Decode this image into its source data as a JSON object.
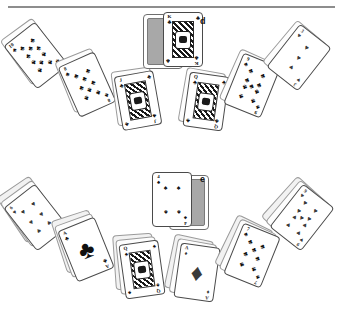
{
  "page": {
    "background": "#ffffff",
    "width": 343,
    "height": 318,
    "divider_color": "#8d8d8d"
  },
  "labels": {
    "top_group": "d",
    "bottom_group": "e"
  },
  "suits": {
    "club": "♣",
    "spade": "♠",
    "heart": "♥",
    "diamond": "♦"
  },
  "groups": [
    {
      "id": "group-d",
      "label": "d",
      "label_x": 200,
      "label_y": 16,
      "description": "Fan of playing cards arranged in an arc, mostly clubs, with a king of clubs and a card back at the apex",
      "cards": [
        {
          "name": "ten-of-clubs",
          "rank": "10",
          "suit": "club",
          "color": "black",
          "kind": "pip",
          "count": 10,
          "x": 16,
          "y": 28,
          "rot": -38,
          "backs": 1
        },
        {
          "name": "eight-of-clubs",
          "rank": "8",
          "suit": "club",
          "color": "black",
          "kind": "pip",
          "count": 8,
          "x": 67,
          "y": 57,
          "rot": -24,
          "backs": 1
        },
        {
          "name": "jack-of-clubs",
          "rank": "J",
          "suit": "club",
          "color": "black",
          "kind": "face",
          "x": 118,
          "y": 73,
          "rot": -10,
          "backs": 1
        },
        {
          "name": "king-of-clubs-center",
          "rank": "K",
          "suit": "club",
          "color": "black",
          "kind": "face",
          "x": 163,
          "y": 12,
          "rot": 0,
          "backs": 1,
          "back_side": "left"
        },
        {
          "name": "queen-of-clubs",
          "rank": "Q",
          "suit": "club",
          "color": "black",
          "kind": "face",
          "x": 186,
          "y": 74,
          "rot": 8,
          "backs": 1
        },
        {
          "name": "nine-of-clubs",
          "rank": "9",
          "suit": "club",
          "color": "black",
          "kind": "pip",
          "count": 9,
          "x": 232,
          "y": 58,
          "rot": 22,
          "backs": 1
        },
        {
          "name": "three-of-hearts",
          "rank": "3",
          "suit": "heart",
          "color": "red",
          "kind": "pip",
          "count": 3,
          "x": 279,
          "y": 30,
          "rot": 38,
          "backs": 1
        }
      ]
    },
    {
      "id": "group-e",
      "label": "e",
      "label_x": 200,
      "label_y": 174,
      "description": "Second fan of playing cards in an arc, mixed suits, with a four of spades and a card back at the apex",
      "cards": [
        {
          "name": "six-of-hearts",
          "rank": "6",
          "suit": "heart",
          "color": "red",
          "kind": "pip",
          "count": 6,
          "x": 16,
          "y": 190,
          "rot": -38,
          "backs": 2
        },
        {
          "name": "ace-of-clubs",
          "rank": "A",
          "suit": "club",
          "color": "black",
          "kind": "ace",
          "x": 66,
          "y": 222,
          "rot": -22,
          "backs": 2
        },
        {
          "name": "queen-of-spades",
          "rank": "Q",
          "suit": "spade",
          "color": "black",
          "kind": "face",
          "x": 122,
          "y": 242,
          "rot": -8,
          "backs": 2
        },
        {
          "name": "four-of-spades-center",
          "rank": "4",
          "suit": "spade",
          "color": "black",
          "kind": "pip",
          "count": 4,
          "x": 152,
          "y": 172,
          "rot": 0,
          "backs": 1,
          "back_side": "right"
        },
        {
          "name": "ace-of-diamonds",
          "rank": "A",
          "suit": "diamond",
          "color": "red",
          "kind": "ace",
          "x": 177,
          "y": 245,
          "rot": 8,
          "backs": 2
        },
        {
          "name": "seven-of-clubs",
          "rank": "7",
          "suit": "club",
          "color": "black",
          "kind": "pip",
          "count": 7,
          "x": 232,
          "y": 228,
          "rot": 22,
          "backs": 2
        },
        {
          "name": "nine-of-hearts",
          "rank": "9",
          "suit": "heart",
          "color": "red",
          "kind": "pip",
          "count": 9,
          "x": 282,
          "y": 190,
          "rot": 38,
          "backs": 2
        }
      ]
    }
  ]
}
